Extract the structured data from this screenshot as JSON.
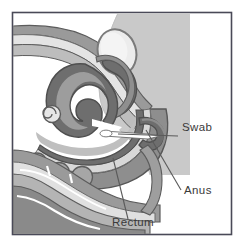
{
  "figure": {
    "kind": "anatomical-illustration",
    "background_color": "#ffffff",
    "frame": {
      "color": "#4a4a58",
      "x": 12,
      "y": 12,
      "width": 220,
      "height": 223
    }
  },
  "palette": {
    "dark_tissue": "#6e6e6e",
    "mid_tissue": "#9a9a9a",
    "light_tissue": "#c6c6c6",
    "pale_tissue": "#e2e2e2",
    "white_lumen": "#ffffff",
    "backdrop_gray": "#c9c9c9",
    "outline": "#5c5c5c",
    "leader_line": "#5a5a5a",
    "label_text": "#3a3a3a"
  },
  "labels": [
    {
      "id": "swab",
      "text": "Swab",
      "text_x": 182,
      "text_y": 131,
      "leader": {
        "x1": 178,
        "y1": 136,
        "x2": 118,
        "y2": 134
      }
    },
    {
      "id": "anus",
      "text": "Anus",
      "text_x": 184,
      "text_y": 194,
      "leader": {
        "x1": 181,
        "y1": 190,
        "x2": 146,
        "y2": 130
      }
    },
    {
      "id": "rectum",
      "text": "Rectum",
      "text_x": 112,
      "text_y": 226,
      "leader": {
        "x1": 128,
        "y1": 219,
        "x2": 113,
        "y2": 158
      }
    }
  ],
  "structures": [
    {
      "id": "backdrop-shade",
      "name": "pelvic-backdrop-shading"
    },
    {
      "id": "abdominal-wall",
      "name": "abdominal-wall-layers"
    },
    {
      "id": "bladder",
      "name": "bladder-oval"
    },
    {
      "id": "colon-loop",
      "name": "sigmoid-colon-loop"
    },
    {
      "id": "rectum-tube",
      "name": "rectum-tube"
    },
    {
      "id": "anal-canal",
      "name": "anal-canal"
    },
    {
      "id": "swab-stick",
      "name": "swab-inserted"
    },
    {
      "id": "sacrum",
      "name": "sacral-vertebrae"
    },
    {
      "id": "gluteal",
      "name": "gluteal-tissue-layers"
    },
    {
      "id": "small-coil",
      "name": "small-bowel-coil"
    }
  ]
}
